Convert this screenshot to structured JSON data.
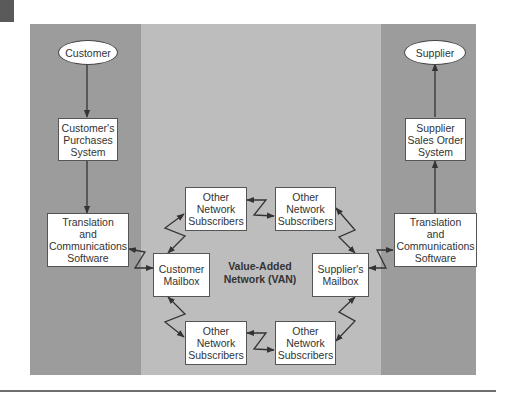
{
  "diagram": {
    "colors": {
      "side_panel": "#9c9c9c",
      "center_panel": "#bdbdbd",
      "node_fill": "#ffffff",
      "line": "#333333",
      "rule": "#6e6e6e"
    },
    "van_label": "Value-Added\nNetwork (VAN)",
    "left_column": {
      "terminal": "Customer",
      "system": "Customer's\nPurchases\nSystem",
      "translation": "Translation\nand\nCommunications\nSoftware"
    },
    "right_column": {
      "terminal": "Supplier",
      "system": "Supplier\nSales Order\nSystem",
      "translation": "Translation\nand\nCommunications\nSoftware"
    },
    "mailboxes": {
      "customer": "Customer\nMailbox",
      "supplier": "Supplier's\nMailbox"
    },
    "subscribers": [
      {
        "position": "top-left",
        "label": "Other\nNetwork\nSubscribers"
      },
      {
        "position": "top-right",
        "label": "Other\nNetwork\nSubscribers"
      },
      {
        "position": "bottom-left",
        "label": "Other\nNetwork\nSubscribers"
      },
      {
        "position": "bottom-right",
        "label": "Other\nNetwork\nSubscribers"
      }
    ],
    "edges": [
      {
        "from": "Customer",
        "to": "Customer's Purchases System",
        "type": "arrow"
      },
      {
        "from": "Customer's Purchases System",
        "to": "Translation and Communications Software (left)",
        "type": "arrow"
      },
      {
        "from": "Translation and Communications Software (left)",
        "to": "Customer Mailbox",
        "type": "bidirectional-lightning"
      },
      {
        "from": "Customer Mailbox",
        "to": "Other Network Subscribers (top-left)",
        "type": "bidirectional-lightning"
      },
      {
        "from": "Customer Mailbox",
        "to": "Other Network Subscribers (bottom-left)",
        "type": "bidirectional-lightning"
      },
      {
        "from": "Other Network Subscribers (top-left)",
        "to": "Other Network Subscribers (top-right)",
        "type": "bidirectional-lightning"
      },
      {
        "from": "Other Network Subscribers (bottom-left)",
        "to": "Other Network Subscribers (bottom-right)",
        "type": "bidirectional-lightning"
      },
      {
        "from": "Other Network Subscribers (top-right)",
        "to": "Supplier's Mailbox",
        "type": "bidirectional-lightning"
      },
      {
        "from": "Other Network Subscribers (bottom-right)",
        "to": "Supplier's Mailbox",
        "type": "bidirectional-lightning"
      },
      {
        "from": "Supplier's Mailbox",
        "to": "Translation and Communications Software (right)",
        "type": "bidirectional-lightning"
      },
      {
        "from": "Translation and Communications Software (right)",
        "to": "Supplier Sales Order System",
        "type": "arrow"
      },
      {
        "from": "Supplier Sales Order System",
        "to": "Supplier",
        "type": "arrow"
      }
    ]
  }
}
